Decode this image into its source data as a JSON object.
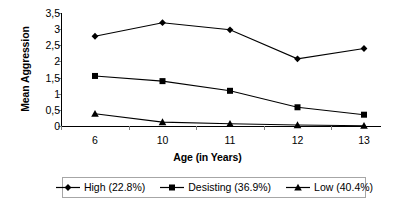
{
  "chart_data": {
    "type": "line",
    "title": "",
    "xlabel": "Age (in Years)",
    "ylabel": "Mean Aggression",
    "categories": [
      "6",
      "10",
      "11",
      "12",
      "13"
    ],
    "ylim": [
      0,
      3.5
    ],
    "yticks": [
      "0",
      "0,5",
      "1",
      "1,5",
      "2",
      "2,5",
      "3",
      "3,5"
    ],
    "ytick_values": [
      0,
      0.5,
      1,
      1.5,
      2,
      2.5,
      3,
      3.5
    ],
    "grid": false,
    "legend_position": "bottom",
    "series": [
      {
        "name": "High (22.8%)",
        "marker": "diamond",
        "values": [
          2.78,
          3.2,
          2.98,
          2.08,
          2.4
        ]
      },
      {
        "name": "Desisting (36.9%)",
        "marker": "square",
        "values": [
          1.55,
          1.39,
          1.09,
          0.58,
          0.35
        ]
      },
      {
        "name": "Low (40.4%)",
        "marker": "triangle",
        "values": [
          0.38,
          0.12,
          0.07,
          0.03,
          0.01
        ]
      }
    ]
  },
  "colors": {
    "series": "#000000",
    "axis": "#000000",
    "tick": "#808080",
    "legend_border": "#a6a6a6",
    "background": "#ffffff"
  }
}
